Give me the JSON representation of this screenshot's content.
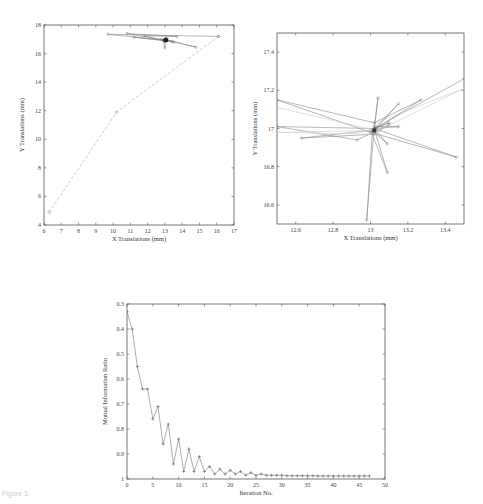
{
  "chart_data": [
    {
      "type": "line",
      "id": "xy-translation-full",
      "title": "",
      "xlabel": "X Translations (mm)",
      "ylabel": "Y Translations (mm)",
      "xlim": [
        6,
        17
      ],
      "ylim": [
        4,
        18
      ],
      "xticks": [
        "6",
        "7",
        "8",
        "9",
        "10",
        "11",
        "12",
        "13",
        "14",
        "15",
        "16",
        "17"
      ],
      "yticks": [
        "4",
        "6",
        "8",
        "10",
        "12",
        "14",
        "16",
        "18"
      ],
      "grid": false,
      "series": [
        {
          "name": "initial path",
          "style": "dashed",
          "x": [
            6.3,
            10.2,
            16.1
          ],
          "y": [
            4.9,
            11.9,
            17.2
          ]
        },
        {
          "name": "refinement path",
          "style": "solid",
          "x": [
            16.1,
            9.7,
            13.0,
            10.8,
            13.7,
            11.8,
            13.0,
            11.2,
            13.4,
            12.8,
            14.8,
            13.0,
            13.5,
            13.05,
            13.0,
            12.9,
            13.1,
            13.05
          ],
          "y": [
            17.2,
            17.35,
            16.95,
            17.4,
            17.2,
            17.25,
            16.9,
            17.15,
            16.85,
            17.0,
            16.45,
            17.0,
            16.8,
            16.95,
            16.4,
            16.9,
            17.05,
            16.95
          ]
        }
      ]
    },
    {
      "type": "line",
      "id": "xy-translation-zoom",
      "title": "",
      "xlabel": "X Translations (mm)",
      "ylabel": "Y Translations (mm)",
      "xlim": [
        12.5,
        13.5
      ],
      "ylim": [
        16.5,
        17.5
      ],
      "xticks": [
        "12.6",
        "12.8",
        "13",
        "13.2",
        "13.4"
      ],
      "yticks": [
        "16.6",
        "16.8",
        "17",
        "17.2",
        "17.4"
      ],
      "grid": false,
      "series": [
        {
          "name": "refinement path",
          "style": "solid",
          "x": [
            13.5,
            13.02,
            13.04,
            13.02,
            13.15,
            13.03,
            13.27,
            13.02,
            12.5,
            13.0,
            13.46,
            13.02,
            12.5,
            12.93,
            13.1,
            13.02,
            12.63,
            13.0,
            13.09,
            13.02,
            13.09,
            13.01,
            12.98,
            13.02,
            13.15,
            13.02,
            13.1,
            13.02
          ],
          "y": [
            17.26,
            17.0,
            17.16,
            17.0,
            17.13,
            17.0,
            17.15,
            17.03,
            17.15,
            16.98,
            16.85,
            17.0,
            17.01,
            16.94,
            17.02,
            16.97,
            16.95,
            16.99,
            16.77,
            17.0,
            16.92,
            16.99,
            16.52,
            17.01,
            17.01,
            17.0,
            17.03,
            17.0
          ]
        },
        {
          "name": "guide lines",
          "style": "solid-light",
          "x": [
            12.5,
            13.03,
            12.5,
            13.0,
            13.5,
            13.03
          ],
          "y": [
            17.11,
            16.99,
            16.98,
            16.97,
            17.21,
            17.03
          ]
        }
      ]
    },
    {
      "type": "line",
      "id": "mutual-information-ratio",
      "title": "",
      "xlabel": "Iteration No.",
      "ylabel": "Mutual Information Ratio",
      "xlim": [
        0,
        50
      ],
      "ylim": [
        1,
        0.3
      ],
      "y_inverted": true,
      "xticks": [
        "0",
        "5",
        "10",
        "15",
        "20",
        "25",
        "30",
        "35",
        "40",
        "45",
        "50"
      ],
      "yticks": [
        "0.3",
        "0.4",
        "0.5",
        "0.6",
        "0.7",
        "0.8",
        "0.9",
        "1"
      ],
      "grid": false,
      "x": [
        0,
        1,
        2,
        3,
        4,
        5,
        6,
        7,
        8,
        9,
        10,
        11,
        12,
        13,
        14,
        15,
        16,
        17,
        18,
        19,
        20,
        21,
        22,
        23,
        24,
        25,
        26,
        27,
        28,
        29,
        30,
        31,
        32,
        33,
        34,
        35,
        36,
        37,
        38,
        39,
        40,
        41,
        42,
        43,
        44,
        45,
        46,
        47
      ],
      "values": [
        0.33,
        0.4,
        0.55,
        0.64,
        0.64,
        0.76,
        0.71,
        0.86,
        0.78,
        0.94,
        0.84,
        0.97,
        0.88,
        0.97,
        0.91,
        0.97,
        0.95,
        0.98,
        0.96,
        0.98,
        0.965,
        0.98,
        0.97,
        0.985,
        0.975,
        0.985,
        0.98,
        0.985,
        0.985,
        0.985,
        0.985,
        0.987,
        0.987,
        0.987,
        0.987,
        0.987,
        0.987,
        0.988,
        0.988,
        0.988,
        0.988,
        0.988,
        0.988,
        0.988,
        0.988,
        0.988,
        0.988,
        0.988
      ]
    }
  ],
  "caption": "Figure 3."
}
